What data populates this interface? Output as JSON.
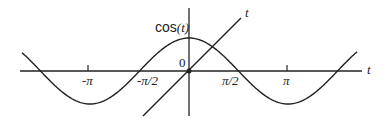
{
  "diagram": {
    "curve_label_prefix": "cos",
    "curve_label_arg": "(t)",
    "line_label": "t",
    "x_axis_label": "t",
    "origin_label": "0",
    "ticks": [
      {
        "label": "-π",
        "value": "-pi"
      },
      {
        "label": "-π/2",
        "value": "-pi/2"
      },
      {
        "label": "π/2",
        "value": "pi/2"
      },
      {
        "label": "π",
        "value": "pi"
      }
    ],
    "colors": {
      "stroke": "#222222",
      "background": "#ffffff"
    }
  }
}
